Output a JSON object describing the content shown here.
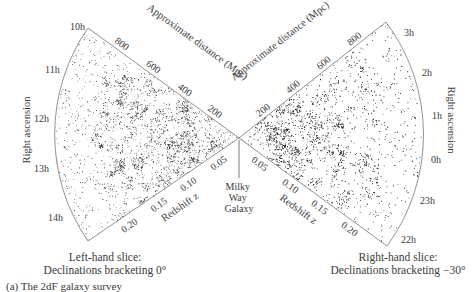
{
  "figure": {
    "caption": "(a)  The 2dF galaxy survey",
    "center_label": [
      "Milky",
      "Way",
      "Galaxy"
    ],
    "left_slice": {
      "caption_line1": "Left-hand slice:",
      "caption_line2": "Declinations bracketing 0°",
      "axis_title": "Right ascension",
      "ra_ticks": [
        "10h",
        "11h",
        "12h",
        "13h",
        "14h"
      ],
      "distance_title": "Approximate distance (Mpc)",
      "distance_ticks": [
        "200",
        "400",
        "600",
        "800"
      ],
      "redshift_title": "Redshift z",
      "redshift_ticks": [
        "0.05",
        "0.10",
        "0.15",
        "0.20"
      ]
    },
    "right_slice": {
      "caption_line1": "Right-hand slice:",
      "caption_line2": "Declinations bracketing −30°",
      "axis_title": "Right ascension",
      "ra_ticks": [
        "3h",
        "2h",
        "1h",
        "0h",
        "23h",
        "22h"
      ],
      "distance_title": "Approximate distance (Mpc)",
      "distance_ticks": [
        "200",
        "400",
        "600",
        "800"
      ],
      "redshift_title": "Redshift z",
      "redshift_ticks": [
        "0.05",
        "0.10",
        "0.15",
        "0.20"
      ]
    },
    "colors": {
      "lines": "#777777",
      "points": "#111111",
      "text": "#3a3a3a"
    }
  }
}
